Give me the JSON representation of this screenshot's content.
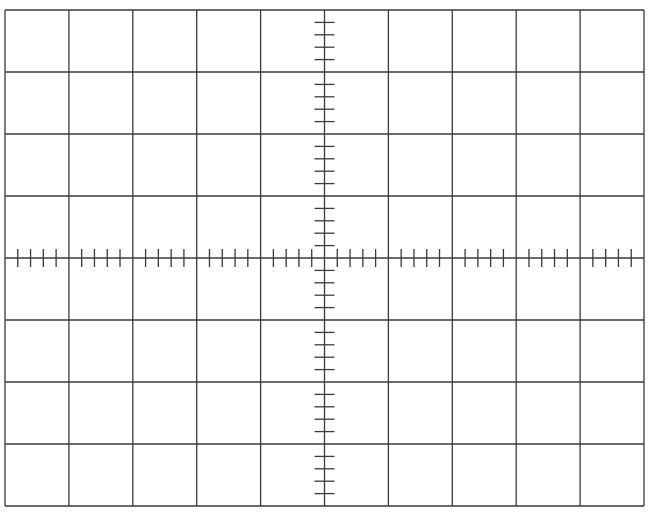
{
  "graticule": {
    "type": "oscilloscope-graticule",
    "columns": 10,
    "rows": 8,
    "minor_ticks_per_division": 5,
    "line_color": "#3a3a3a",
    "background_color": "#ffffff",
    "bounds": {
      "left": 5,
      "top": 10,
      "right": 644,
      "bottom": 506
    }
  }
}
